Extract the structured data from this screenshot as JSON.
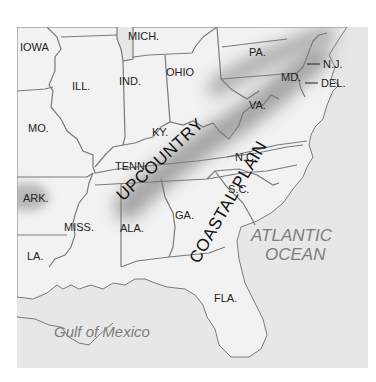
{
  "map": {
    "states": [
      {
        "id": "iowa",
        "label": "IOWA"
      },
      {
        "id": "mich",
        "label": "MICH."
      },
      {
        "id": "pa",
        "label": "PA."
      },
      {
        "id": "nj",
        "label": "N.J."
      },
      {
        "id": "ill",
        "label": "ILL."
      },
      {
        "id": "ind",
        "label": "IND."
      },
      {
        "id": "ohio",
        "label": "OHIO"
      },
      {
        "id": "md",
        "label": "MD."
      },
      {
        "id": "del",
        "label": "DEL."
      },
      {
        "id": "mo",
        "label": "MO."
      },
      {
        "id": "ky",
        "label": "KY."
      },
      {
        "id": "va",
        "label": "VA."
      },
      {
        "id": "tenn",
        "label": "TENN."
      },
      {
        "id": "nc",
        "label": "N.C."
      },
      {
        "id": "ark",
        "label": "ARK."
      },
      {
        "id": "sc",
        "label": "S.C."
      },
      {
        "id": "miss",
        "label": "MISS."
      },
      {
        "id": "ala",
        "label": "ALA."
      },
      {
        "id": "ga",
        "label": "GA."
      },
      {
        "id": "la",
        "label": "LA."
      },
      {
        "id": "fla",
        "label": "FLA."
      }
    ],
    "regions": [
      {
        "id": "upcountry",
        "label": "UPCOUNTRY"
      },
      {
        "id": "coastal_plain",
        "label": "COASTAL PLAIN"
      }
    ],
    "water_bodies": [
      {
        "id": "atlantic_line1",
        "label": "ATLANTIC"
      },
      {
        "id": "atlantic_line2",
        "label": "OCEAN"
      },
      {
        "id": "gulf",
        "label": "Gulf of Mexico"
      }
    ],
    "colors": {
      "land": "#f1f1f1",
      "water": "#e6e6e6",
      "border": "#7a7a7a",
      "relief": "#9a9a9a",
      "label": "#222222",
      "water_label": "#7d7d7d"
    }
  }
}
